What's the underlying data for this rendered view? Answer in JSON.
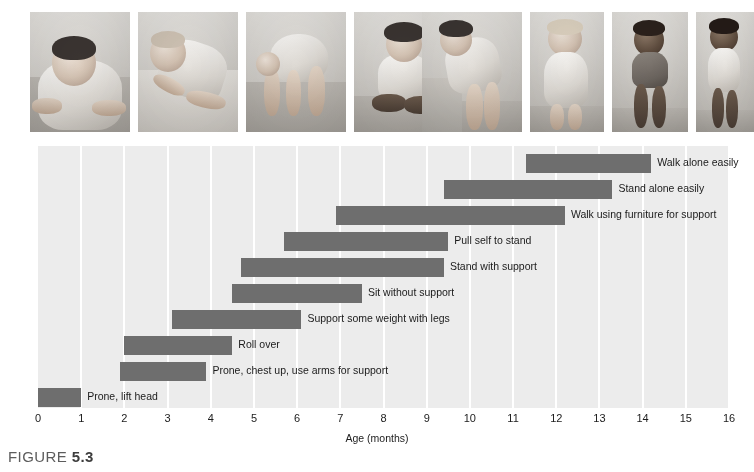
{
  "figure": {
    "caption_prefix": "FIGURE",
    "caption_number": "5.3"
  },
  "photos": [
    {
      "name": "baby-prone-lifting-head",
      "alt": "Infant lying prone lifting head and chest"
    },
    {
      "name": "baby-rolling-over",
      "alt": "Infant rolling over on a blanket"
    },
    {
      "name": "baby-crawling",
      "alt": "Infant on hands and knees crawling"
    },
    {
      "name": "baby-sitting-unsupported",
      "alt": "Infant sitting without support"
    },
    {
      "name": "baby-pulling-to-stand",
      "alt": "Infant pulling self up on a low table"
    },
    {
      "name": "baby-standing-with-support",
      "alt": "Infant standing while holding furniture"
    },
    {
      "name": "baby-walking-with-help",
      "alt": "Infant walking while held by an adult"
    },
    {
      "name": "baby-walking-alone",
      "alt": "Toddler walking alone"
    }
  ],
  "chart_data": {
    "type": "bar",
    "orientation": "horizontal",
    "subtype": "range-bar",
    "title": "",
    "xlabel": "Age (months)",
    "ylabel": "Degree of motor development",
    "xlim": [
      0,
      16
    ],
    "ylim": [
      0,
      10
    ],
    "grid": "vertical",
    "legend": "none",
    "bar_color": "#6e6e6e",
    "plot_background": "#ececec",
    "gridline_color": "#ffffff",
    "xticks": [
      0,
      1,
      2,
      3,
      4,
      5,
      6,
      7,
      8,
      9,
      10,
      11,
      12,
      13,
      14,
      15,
      16
    ],
    "xtick_labels": [
      "0",
      "1",
      "2",
      "3",
      "4",
      "5",
      "6",
      "7",
      "8",
      "9",
      "10",
      "11",
      "12",
      "13",
      "14",
      "15",
      "16"
    ],
    "categories": [
      "Walk alone easily",
      "Stand alone easily",
      "Walk using furniture for support",
      "Pull self to stand",
      "Stand with support",
      "Sit without support",
      "Support some weight with legs",
      "Roll over",
      "Prone, chest up, use arms for support",
      "Prone, lift head"
    ],
    "ranges": [
      {
        "label": "Walk alone easily",
        "start": 11.3,
        "end": 14.2
      },
      {
        "label": "Stand alone easily",
        "start": 9.4,
        "end": 13.3
      },
      {
        "label": "Walk using furniture for support",
        "start": 6.9,
        "end": 12.2
      },
      {
        "label": "Pull self to stand",
        "start": 5.7,
        "end": 9.5
      },
      {
        "label": "Stand with support",
        "start": 4.7,
        "end": 9.4
      },
      {
        "label": "Sit without support",
        "start": 4.5,
        "end": 7.5
      },
      {
        "label": "Support some weight with legs",
        "start": 3.1,
        "end": 6.1
      },
      {
        "label": "Roll over",
        "start": 2.0,
        "end": 4.5
      },
      {
        "label": "Prone, chest up, use arms for support",
        "start": 1.9,
        "end": 3.9
      },
      {
        "label": "Prone, lift head",
        "start": 0.0,
        "end": 1.0
      }
    ]
  }
}
